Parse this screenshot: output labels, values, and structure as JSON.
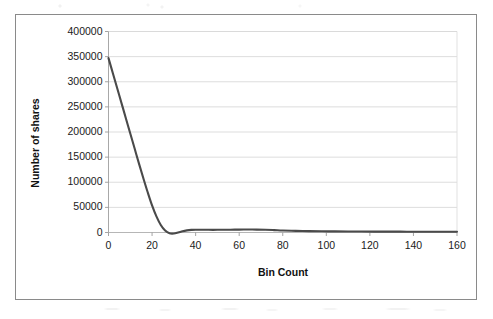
{
  "figure": {
    "frame_border_color": "#8a8a8a",
    "background": "#ffffff"
  },
  "chart_data": {
    "type": "line",
    "title": "",
    "xlabel": "Bin Count",
    "ylabel": "Number of shares",
    "xlim": [
      0,
      160
    ],
    "ylim": [
      0,
      400000
    ],
    "xticks": [
      0,
      20,
      40,
      60,
      80,
      100,
      120,
      140,
      160
    ],
    "yticks": [
      0,
      50000,
      100000,
      150000,
      200000,
      250000,
      300000,
      350000,
      400000
    ],
    "xtick_labels": [
      "0",
      "20",
      "40",
      "60",
      "80",
      "100",
      "120",
      "140",
      "160"
    ],
    "ytick_labels": [
      "0",
      "50000",
      "100000",
      "150000",
      "200000",
      "250000",
      "300000",
      "350000",
      "400000"
    ],
    "grid": "horizontal",
    "grid_color": "#d9d9d9",
    "legend": "none",
    "series": [
      {
        "name": "Number of shares",
        "color": "#4a4a4a",
        "line_width": 2.1,
        "x": [
          0,
          2,
          4,
          6,
          8,
          10,
          12,
          14,
          16,
          18,
          20,
          22,
          24,
          26,
          28,
          30,
          32,
          34,
          36,
          38,
          40,
          44,
          48,
          52,
          56,
          60,
          64,
          68,
          72,
          76,
          80,
          86,
          92,
          98,
          104,
          110,
          116,
          122,
          128,
          134,
          140,
          146,
          152,
          160
        ],
        "y": [
          347000,
          317000,
          287000,
          257000,
          227000,
          197000,
          167000,
          137000,
          108000,
          80000,
          54000,
          32000,
          15000,
          4000,
          -1500,
          -2000,
          0,
          2500,
          4200,
          5200,
          5600,
          5400,
          5300,
          5400,
          5600,
          5800,
          5900,
          5800,
          5500,
          4800,
          4000,
          3200,
          2700,
          2400,
          2200,
          2000,
          1900,
          1800,
          1700,
          1650,
          1600,
          1550,
          1500,
          1400
        ]
      }
    ]
  }
}
